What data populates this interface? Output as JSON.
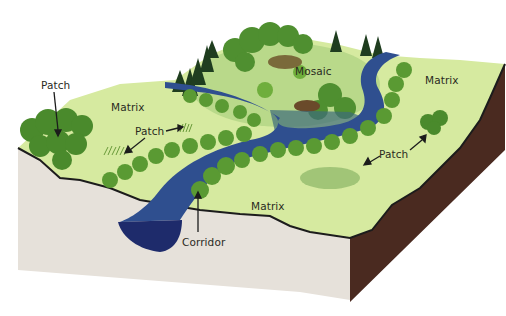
{
  "diagram": {
    "labels": {
      "patch_top_left": "Patch",
      "matrix_left": "Matrix",
      "patch_center_left": "Patch",
      "mosaic": "Mosaic",
      "matrix_right": "Matrix",
      "patch_right": "Patch",
      "matrix_bottom": "Matrix",
      "corridor": "Corridor"
    },
    "colors": {
      "matrix_grass": "#d6eaa0",
      "tree_dark": "#3f7f2a",
      "tree_light": "#6fae3c",
      "river": "#2f4f8f",
      "river_deep": "#1e2b6b",
      "soil_front": "#e6e1da",
      "soil_side": "#4a2a20",
      "outline": "#1c1c1c"
    }
  }
}
